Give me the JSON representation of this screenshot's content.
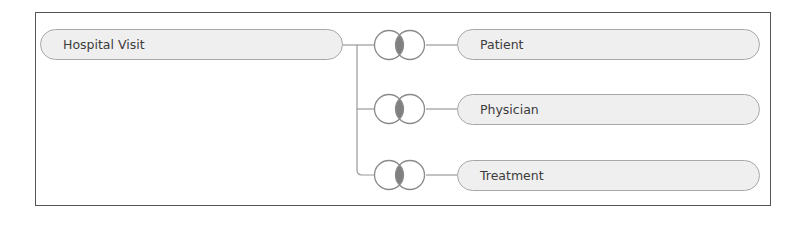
{
  "diagram": {
    "type": "entity-relationship",
    "root": {
      "label": "Hospital Visit"
    },
    "relationship_icon": "venn-join-icon",
    "children": [
      {
        "label": "Patient",
        "join_type": "inner-join"
      },
      {
        "label": "Physician",
        "join_type": "inner-join"
      },
      {
        "label": "Treatment",
        "join_type": "inner-join"
      }
    ]
  },
  "colors": {
    "frame_border": "#555555",
    "pill_fill": "#efefef",
    "pill_border": "#a8a8a8",
    "text": "#3c3c3c",
    "connector": "#999999",
    "venn_stroke": "#8a8a8a",
    "venn_overlap": "#808080"
  }
}
